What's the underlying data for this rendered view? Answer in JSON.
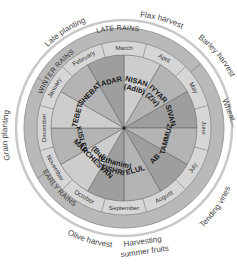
{
  "colors": {
    "season_band": "#b9b9b9",
    "month_band": "#d6d6d6",
    "hebrew_dark": "#9e9e9e",
    "hebrew_mid": "#b4b4b4",
    "hebrew_light": "#cdcdcd",
    "arrow_ring": "#c8c8c8",
    "text": "#333333"
  },
  "seasons": [
    {
      "label": "LATE RAINS"
    },
    {
      "label": "WINTER RAINS"
    },
    {
      "label": "EARLY RAINS"
    }
  ],
  "months": [
    {
      "gregorian": "March",
      "hebrew": "NISAN",
      "alt": "(Adib)"
    },
    {
      "gregorian": "April",
      "hebrew": "IYYAR",
      "alt": "(Ziv)"
    },
    {
      "gregorian": "May",
      "hebrew": "SIVAN",
      "alt": ""
    },
    {
      "gregorian": "June",
      "hebrew": "TAMMUZ",
      "alt": ""
    },
    {
      "gregorian": "July",
      "hebrew": "AB",
      "alt": ""
    },
    {
      "gregorian": "August",
      "hebrew": "ELUL",
      "alt": ""
    },
    {
      "gregorian": "September",
      "hebrew": "TISHRI",
      "alt": "(Ethanim)"
    },
    {
      "gregorian": "October",
      "hebrew": "MARCHESVAN",
      "alt": "(Bul)"
    },
    {
      "gregorian": "November",
      "hebrew": "KISLEV",
      "alt": ""
    },
    {
      "gregorian": "December",
      "hebrew": "TEBET",
      "alt": ""
    },
    {
      "gregorian": "January",
      "hebrew": "SHEBAT",
      "alt": ""
    },
    {
      "gregorian": "February",
      "hebrew": "ADAR",
      "alt": ""
    }
  ],
  "activities": [
    {
      "label": "Flax harvest"
    },
    {
      "label": "Barley harvest"
    },
    {
      "label": "Wheat..."
    },
    {
      "label": "Tending vines"
    },
    {
      "label": "Harvesting"
    },
    {
      "label": "summer fruits"
    },
    {
      "label": "Olive harvest"
    },
    {
      "label": "Grain planting"
    },
    {
      "label": "Late planting"
    }
  ]
}
